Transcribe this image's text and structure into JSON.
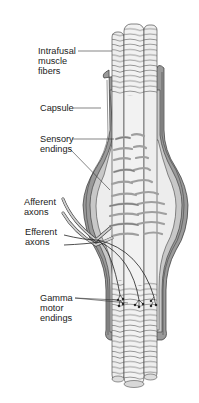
{
  "diagram": {
    "labels": {
      "intrafusal": {
        "lines": [
          "Intrafusal",
          "muscle",
          "fibers"
        ]
      },
      "capsule": {
        "lines": [
          "Capsule"
        ]
      },
      "sensory": {
        "lines": [
          "Sensory",
          "endings"
        ]
      },
      "afferent": {
        "lines": [
          "Afferent",
          "axons"
        ]
      },
      "efferent": {
        "lines": [
          "Efferent",
          "axons"
        ]
      },
      "gamma": {
        "lines": [
          "Gamma",
          "motor",
          "endings"
        ]
      }
    },
    "colors": {
      "background": "#ffffff",
      "capsule_fill": "#9a9a9a",
      "capsule_inner": "#c8c8c8",
      "fiber_fill": "#ececec",
      "outline": "#333333",
      "sensory_ending": "#bdbdbd",
      "text": "#222222"
    }
  }
}
